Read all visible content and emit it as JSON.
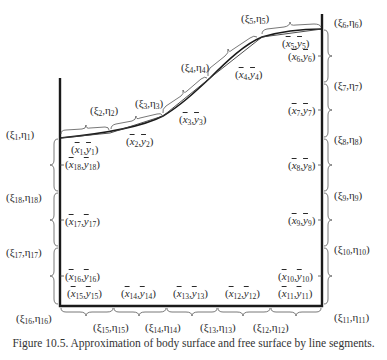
{
  "caption": "Figure 10.5. Approximation of body surface and free surface by line segments.",
  "colors": {
    "line": "#1a1a1a",
    "brace": "#555555",
    "text": "#2a2a2a"
  },
  "node_labels": [
    {
      "id": 1,
      "text": "(ξ1,η1)",
      "x": 6,
      "y": 128
    },
    {
      "id": 2,
      "text": "(ξ2,η2)",
      "x": 90,
      "y": 104
    },
    {
      "id": 3,
      "text": "(ξ3,η3)",
      "x": 135,
      "y": 97
    },
    {
      "id": 4,
      "text": "(ξ4,η4)",
      "x": 181,
      "y": 61
    },
    {
      "id": 5,
      "text": "(ξ5,η5)",
      "x": 241,
      "y": 12
    },
    {
      "id": 6,
      "text": "(ξ6,η6)",
      "x": 334,
      "y": 16
    },
    {
      "id": 7,
      "text": "(ξ7,η7)",
      "x": 334,
      "y": 79
    },
    {
      "id": 8,
      "text": "(ξ8,η8)",
      "x": 334,
      "y": 133
    },
    {
      "id": 9,
      "text": "(ξ9,η9)",
      "x": 334,
      "y": 189
    },
    {
      "id": 10,
      "text": "(ξ10,η10)",
      "x": 334,
      "y": 243
    },
    {
      "id": 11,
      "text": "(ξ11,η11)",
      "x": 334,
      "y": 311
    },
    {
      "id": 12,
      "text": "(ξ12,η12)",
      "x": 253,
      "y": 321
    },
    {
      "id": 13,
      "text": "(ξ13,η13)",
      "x": 200,
      "y": 321
    },
    {
      "id": 14,
      "text": "(ξ14,η14)",
      "x": 145,
      "y": 321
    },
    {
      "id": 15,
      "text": "(ξ15,η15)",
      "x": 93,
      "y": 321
    },
    {
      "id": 16,
      "text": "(ξ16,η16)",
      "x": 16,
      "y": 312
    },
    {
      "id": 17,
      "text": "(ξ17,η17)",
      "x": 6,
      "y": 246
    },
    {
      "id": 18,
      "text": "(ξ18,η18)",
      "x": 6,
      "y": 191
    }
  ],
  "midpoint_labels": [
    {
      "id": 1,
      "text": "(x̄1,ȳ1)",
      "x": 71,
      "y": 143
    },
    {
      "id": 2,
      "text": "(x̄2,ȳ2)",
      "x": 126,
      "y": 135
    },
    {
      "id": 3,
      "text": "(x̄3,ȳ3)",
      "x": 179,
      "y": 113
    },
    {
      "id": 4,
      "text": "(x̄4,ȳ4)",
      "x": 235,
      "y": 68
    },
    {
      "id": 5,
      "text": "(x̄5,ȳ5)",
      "x": 282,
      "y": 37
    },
    {
      "id": 6,
      "text": "(x̄6,ȳ6)",
      "x": 288,
      "y": 50
    },
    {
      "id": 7,
      "text": "(x̄7,ȳ7)",
      "x": 288,
      "y": 104
    },
    {
      "id": 8,
      "text": "(x̄8,ȳ8)",
      "x": 288,
      "y": 159
    },
    {
      "id": 9,
      "text": "(x̄9,ȳ9)",
      "x": 288,
      "y": 214
    },
    {
      "id": 10,
      "text": "(x̄10,ȳ10)",
      "x": 278,
      "y": 272
    },
    {
      "id": 11,
      "text": "(x̄11,ȳ11)",
      "x": 278,
      "y": 288
    },
    {
      "id": 12,
      "text": "(x̄12,ȳ12)",
      "x": 225,
      "y": 288
    },
    {
      "id": 13,
      "text": "(x̄13,ȳ13)",
      "x": 173,
      "y": 288
    },
    {
      "id": 14,
      "text": "(x̄14,ȳ14)",
      "x": 121,
      "y": 288
    },
    {
      "id": 15,
      "text": "(x̄15,ȳ15)",
      "x": 67,
      "y": 288
    },
    {
      "id": 16,
      "text": "(x̄16,ȳ16)",
      "x": 65,
      "y": 270
    },
    {
      "id": 17,
      "text": "(x̄17,ȳ17)",
      "x": 65,
      "y": 215
    },
    {
      "id": 18,
      "text": "(x̄18,ȳ18)",
      "x": 65,
      "y": 158
    }
  ]
}
